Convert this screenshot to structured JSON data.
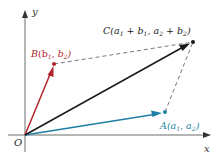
{
  "diagram": {
    "axes": {
      "x_label": "x",
      "y_label": "y",
      "origin_label": "O"
    },
    "points": {
      "A": {
        "name": "A",
        "coords_text": "(a",
        "sub1": "1",
        "mid": ", a",
        "sub2": "2",
        "end": ")",
        "color": "#1f7fa6"
      },
      "B": {
        "name": "B",
        "coords_text": "(b",
        "sub1": "1",
        "mid": ", b",
        "sub2": "2",
        "end": ")",
        "color": "#b0262c"
      },
      "C": {
        "name": "C",
        "part1": "(a",
        "s1": "1",
        "part2": " + b",
        "s2": "1",
        "part3": ", a",
        "s3": "2",
        "part4": " + b",
        "s4": "2",
        "part5": ")",
        "color": "#1a1a1a"
      }
    },
    "colors": {
      "axis": "#6d6d6d",
      "vector_a": "#1f7fa6",
      "vector_b": "#b0262c",
      "vector_c": "#1a1a1a",
      "dashed": "#555555"
    }
  }
}
